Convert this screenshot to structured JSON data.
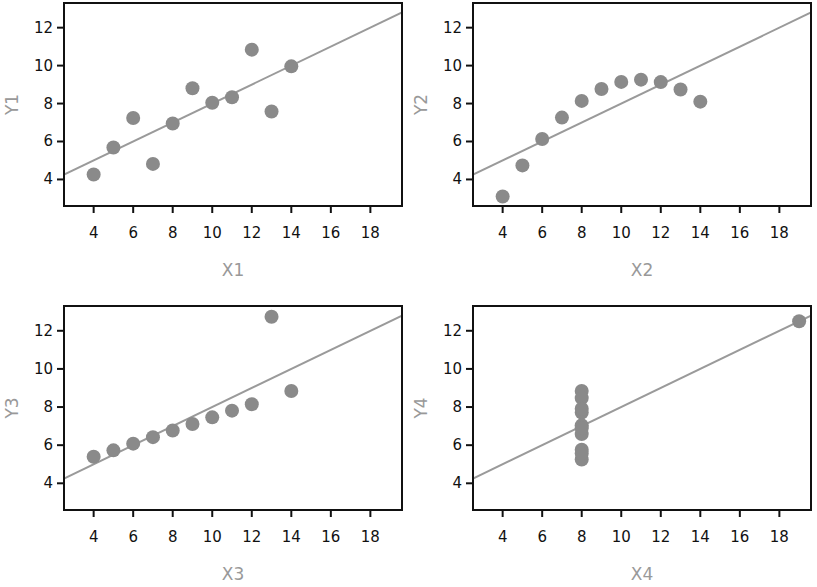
{
  "chart_data": [
    {
      "type": "scatter",
      "title": "",
      "xlabel": "X1",
      "ylabel": "Y1",
      "xlim": [
        2.5,
        19.6
      ],
      "ylim": [
        2.6,
        13.3
      ],
      "xticks": [
        4,
        6,
        8,
        10,
        12,
        14,
        16,
        18
      ],
      "yticks": [
        4,
        6,
        8,
        10,
        12
      ],
      "grid": false,
      "x": [
        10,
        8,
        13,
        9,
        11,
        14,
        6,
        4,
        12,
        7,
        5
      ],
      "y": [
        8.04,
        6.95,
        7.58,
        8.81,
        8.33,
        9.96,
        7.24,
        4.26,
        10.84,
        4.82,
        5.68
      ],
      "fit_line": {
        "slope": 0.5,
        "intercept": 3.0
      }
    },
    {
      "type": "scatter",
      "title": "",
      "xlabel": "X2",
      "ylabel": "Y2",
      "xlim": [
        2.5,
        19.6
      ],
      "ylim": [
        2.6,
        13.3
      ],
      "xticks": [
        4,
        6,
        8,
        10,
        12,
        14,
        16,
        18
      ],
      "yticks": [
        4,
        6,
        8,
        10,
        12
      ],
      "grid": false,
      "x": [
        10,
        8,
        13,
        9,
        11,
        14,
        6,
        4,
        12,
        7,
        5
      ],
      "y": [
        9.14,
        8.14,
        8.74,
        8.77,
        9.26,
        8.1,
        6.13,
        3.1,
        9.13,
        7.26,
        4.74
      ],
      "fit_line": {
        "slope": 0.5,
        "intercept": 3.0
      }
    },
    {
      "type": "scatter",
      "title": "",
      "xlabel": "X3",
      "ylabel": "Y3",
      "xlim": [
        2.5,
        19.6
      ],
      "ylim": [
        2.6,
        13.3
      ],
      "xticks": [
        4,
        6,
        8,
        10,
        12,
        14,
        16,
        18
      ],
      "yticks": [
        4,
        6,
        8,
        10,
        12
      ],
      "grid": false,
      "x": [
        10,
        8,
        13,
        9,
        11,
        14,
        6,
        4,
        12,
        7,
        5
      ],
      "y": [
        7.46,
        6.77,
        12.74,
        7.11,
        7.81,
        8.84,
        6.08,
        5.39,
        8.15,
        6.42,
        5.73
      ],
      "fit_line": {
        "slope": 0.5,
        "intercept": 3.0
      }
    },
    {
      "type": "scatter",
      "title": "",
      "xlabel": "X4",
      "ylabel": "Y4",
      "xlim": [
        2.5,
        19.6
      ],
      "ylim": [
        2.6,
        13.3
      ],
      "xticks": [
        4,
        6,
        8,
        10,
        12,
        14,
        16,
        18
      ],
      "yticks": [
        4,
        6,
        8,
        10,
        12
      ],
      "grid": false,
      "x": [
        8,
        8,
        8,
        8,
        8,
        8,
        8,
        19,
        8,
        8,
        8
      ],
      "y": [
        6.58,
        5.76,
        7.71,
        8.84,
        8.47,
        7.04,
        5.25,
        12.5,
        5.56,
        7.91,
        6.89
      ],
      "fit_line": {
        "slope": 0.5,
        "intercept": 3.0
      }
    }
  ],
  "colors": {
    "points": "#8a8a8a",
    "fit_line": "#9a9a9a",
    "axis_label": "#999999",
    "frame": "#111111"
  }
}
